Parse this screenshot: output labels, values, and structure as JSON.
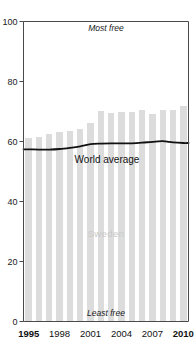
{
  "chart_data": {
    "type": "bar",
    "title": "",
    "xlabel": "",
    "ylabel": "",
    "ylim": [
      0,
      100
    ],
    "yticks": [
      0,
      20,
      40,
      60,
      80,
      100
    ],
    "xticks": [
      "1995",
      "1998",
      "2001",
      "2004",
      "2007",
      "2010"
    ],
    "grid": false,
    "legend": "none",
    "categories": [
      "1995",
      "1996",
      "1997",
      "1998",
      "1999",
      "2000",
      "2001",
      "2002",
      "2003",
      "2004",
      "2005",
      "2006",
      "2007",
      "2008",
      "2009",
      "2010"
    ],
    "series": [
      {
        "name": "Sweden",
        "type": "bar",
        "color": "#dcdcdc",
        "values": [
          61.1,
          61.4,
          62.6,
          63.3,
          63.4,
          64.3,
          66.2,
          70.1,
          69.6,
          69.8,
          69.9,
          70.4,
          69.3,
          70.4,
          70.4,
          72.0
        ]
      },
      {
        "name": "World average",
        "type": "line",
        "color": "#111111",
        "values": [
          57.4,
          57.3,
          57.3,
          57.5,
          57.9,
          58.4,
          59.1,
          59.3,
          59.4,
          59.4,
          59.4,
          59.6,
          59.9,
          60.1,
          59.7,
          59.5
        ]
      }
    ],
    "annotations": [
      {
        "name": "most-free",
        "text": "Most free",
        "x": 2002.5,
        "y": 97,
        "style": "italic"
      },
      {
        "name": "least-free",
        "text": "Least free",
        "x": 2002.5,
        "y": 3,
        "style": "italic"
      },
      {
        "name": "world-average",
        "text": "World average",
        "x": 2002.6,
        "y": 51.5,
        "style": "plain"
      },
      {
        "name": "sweden",
        "text": "Sweden",
        "x": 2002.5,
        "y": 31,
        "style": "gray"
      }
    ]
  },
  "axes": {
    "y_labels": [
      "100",
      "80",
      "60",
      "40",
      "20",
      "0"
    ],
    "x_labels": [
      {
        "text": "1995",
        "bold": true
      },
      {
        "text": "1998",
        "bold": false
      },
      {
        "text": "2001",
        "bold": false
      },
      {
        "text": "2004",
        "bold": false
      },
      {
        "text": "2007",
        "bold": false
      },
      {
        "text": "2010",
        "bold": true
      }
    ]
  },
  "annotations": {
    "most_free": "Most free",
    "least_free": "Least free",
    "world_average": "World average",
    "sweden": "Sweden"
  },
  "colors": {
    "bar": "#dcdcdc",
    "line": "#111111",
    "axis": "#4a4a4a",
    "sweden_label": "#c9c9c9",
    "background": "#ffffff"
  }
}
